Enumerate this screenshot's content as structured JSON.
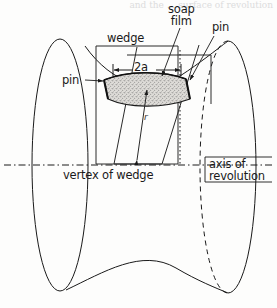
{
  "figure": {
    "kind": "line-diagram",
    "background_color": "#fdfdfc",
    "ink_color": "#1a1a1a",
    "film_fill_color": "#d8d6d2",
    "cropped_header_text": "and the ... surface of revolution",
    "labels": {
      "soap_film_line1": "soap",
      "soap_film_line2": "film",
      "wedge": "wedge",
      "pin_right": "pin",
      "pin_left": "pin",
      "half_width": "2a",
      "radius": "r",
      "vertex_of_wedge": "vertex of wedge",
      "axis_line1": "axis of",
      "axis_line2": "revolution"
    }
  }
}
